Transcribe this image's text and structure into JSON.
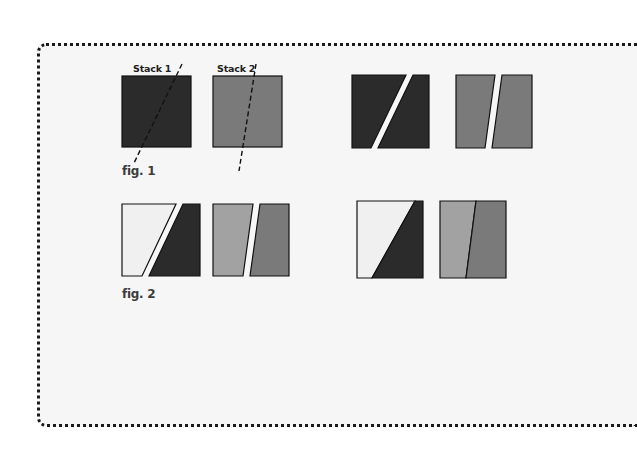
{
  "figure1": {
    "caption": "fig. 1",
    "stacks": [
      {
        "label": "Stack 1",
        "color": "#2b2b2b"
      },
      {
        "label": "Stack 2",
        "color": "#7a7a7a"
      }
    ]
  },
  "figure2": {
    "caption": "fig. 2"
  },
  "colors": {
    "dark": "#2b2b2b",
    "mid_gray": "#7a7a7a",
    "light_gray": "#a2a2a2",
    "very_light": "#f0f0f0",
    "outline": "#111111",
    "frame_bg": "#f6f6f6"
  }
}
